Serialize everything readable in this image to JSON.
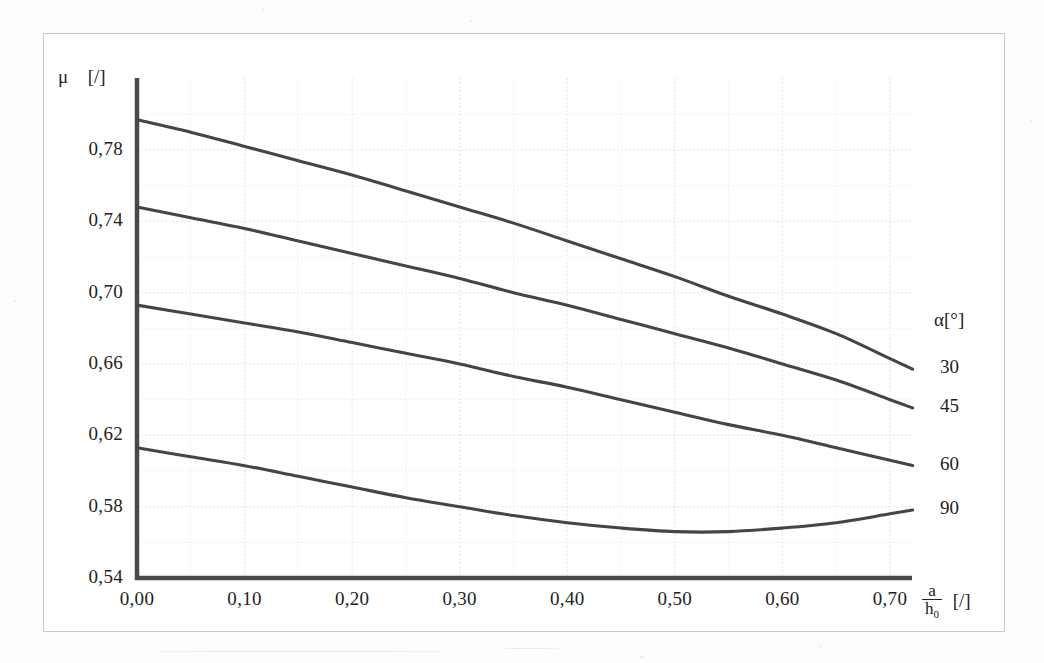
{
  "figure": {
    "background_color": "#fdfdfc",
    "frame_color": "#c8c8c4",
    "curve_color": "#454545",
    "axis_color": "#4a4a4a",
    "grid_color": "#d9d9d9"
  },
  "axes": {
    "y_axis_title_symbol": "μ",
    "y_axis_title_unit": "[/]",
    "x_axis_title_numerator": "a",
    "x_axis_title_denominator_base": "h",
    "x_axis_title_denominator_sub": "0",
    "x_axis_title_unit": "[/]",
    "y_ticks": [
      "0,54",
      "0,58",
      "0,62",
      "0,66",
      "0,70",
      "0,74",
      "0,78"
    ],
    "x_ticks": [
      "0,00",
      "0,10",
      "0,20",
      "0,30",
      "0,40",
      "0,50",
      "0,60",
      "0,70"
    ]
  },
  "legend": {
    "header": "α[°]",
    "entries": [
      "30",
      "45",
      "60",
      "90"
    ]
  },
  "chart_data": {
    "type": "line",
    "title": "",
    "subtitle": "",
    "xlabel": "a/h0 [/]",
    "ylabel": "μ [/]",
    "xlim": [
      0.0,
      0.7
    ],
    "ylim": [
      0.54,
      0.8
    ],
    "xticks": [
      0.0,
      0.1,
      0.2,
      0.3,
      0.4,
      0.5,
      0.6,
      0.7
    ],
    "ytick_values": [
      0.54,
      0.58,
      0.62,
      0.66,
      0.7,
      0.74,
      0.78
    ],
    "grid": true,
    "grid_minor_x_step": 0.05,
    "grid_minor_y_step": 0.02,
    "legend_position": "right-outside",
    "legend_title": "α[°]",
    "x": [
      0.0,
      0.05,
      0.1,
      0.15,
      0.2,
      0.25,
      0.3,
      0.35,
      0.4,
      0.45,
      0.5,
      0.55,
      0.6,
      0.65,
      0.7
    ],
    "series": [
      {
        "name": "30",
        "values": [
          0.797,
          0.79,
          0.782,
          0.774,
          0.766,
          0.757,
          0.748,
          0.739,
          0.729,
          0.719,
          0.709,
          0.698,
          0.688,
          0.677,
          0.663
        ]
      },
      {
        "name": "45",
        "values": [
          0.748,
          0.742,
          0.736,
          0.729,
          0.722,
          0.715,
          0.708,
          0.7,
          0.693,
          0.685,
          0.677,
          0.669,
          0.66,
          0.651,
          0.64
        ]
      },
      {
        "name": "60",
        "values": [
          0.693,
          0.688,
          0.683,
          0.678,
          0.672,
          0.666,
          0.66,
          0.653,
          0.647,
          0.64,
          0.633,
          0.626,
          0.62,
          0.613,
          0.606
        ]
      },
      {
        "name": "90",
        "values": [
          0.613,
          0.608,
          0.603,
          0.597,
          0.591,
          0.585,
          0.58,
          0.575,
          0.571,
          0.568,
          0.566,
          0.566,
          0.568,
          0.571,
          0.576
        ]
      }
    ]
  }
}
